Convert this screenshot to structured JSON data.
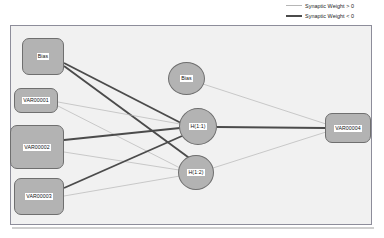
{
  "legend": {
    "items": [
      {
        "label": "Synaptic Weight > 0",
        "style": "thin-light",
        "color": "#b6b6b6"
      },
      {
        "label": "Synaptic Weight < 0",
        "style": "thick-dark",
        "color": "#4b4b4b"
      }
    ]
  },
  "diagram": {
    "panel_background": "#f1f1f1",
    "node_fill": "#b3b3b3",
    "node_stroke": "#6f6f6f",
    "layers": {
      "input": {
        "name": "Input Layer",
        "nodes": [
          {
            "id": "in-bias",
            "label": "Bias",
            "shape": "box",
            "x": 22,
            "y": 38,
            "w": 42,
            "h": 37
          },
          {
            "id": "in-var1",
            "label": "VAR00001",
            "shape": "box",
            "x": 14,
            "y": 88,
            "w": 44,
            "h": 25
          },
          {
            "id": "in-var2",
            "label": "VAR00002",
            "shape": "box",
            "x": 10,
            "y": 125,
            "w": 54,
            "h": 44
          },
          {
            "id": "in-var3",
            "label": "VAR00003",
            "shape": "box",
            "x": 14,
            "y": 178,
            "w": 50,
            "h": 37
          }
        ]
      },
      "hidden": {
        "name": "Hidden Layer",
        "nodes": [
          {
            "id": "h-bias",
            "label": "Bias",
            "shape": "ellipse",
            "x": 168,
            "y": 62,
            "w": 37,
            "h": 33
          },
          {
            "id": "h-1-1",
            "label": "H(1:1)",
            "shape": "ellipse",
            "x": 179,
            "y": 108,
            "w": 38,
            "h": 37
          },
          {
            "id": "h-1-2",
            "label": "H(1:2)",
            "shape": "ellipse",
            "x": 178,
            "y": 155,
            "w": 36,
            "h": 35
          }
        ]
      },
      "output": {
        "name": "Output Layer",
        "nodes": [
          {
            "id": "out-var4",
            "label": "VAR00004",
            "shape": "box",
            "x": 325,
            "y": 113,
            "w": 46,
            "h": 30
          }
        ]
      }
    },
    "edges": [
      {
        "from": "in-bias",
        "to": "h-1-1",
        "sign": "negative",
        "x1": 64,
        "y1": 63,
        "x2": 181,
        "y2": 123
      },
      {
        "from": "in-bias",
        "to": "h-1-2",
        "sign": "negative",
        "x1": 64,
        "y1": 66,
        "x2": 192,
        "y2": 160
      },
      {
        "from": "in-var1",
        "to": "h-1-1",
        "sign": "positive",
        "x1": 58,
        "y1": 102,
        "x2": 180,
        "y2": 124
      },
      {
        "from": "in-var1",
        "to": "h-1-2",
        "sign": "positive",
        "x1": 58,
        "y1": 106,
        "x2": 180,
        "y2": 168
      },
      {
        "from": "in-var2",
        "to": "h-1-1",
        "sign": "negative",
        "x1": 64,
        "y1": 140,
        "x2": 180,
        "y2": 128
      },
      {
        "from": "in-var2",
        "to": "h-1-2",
        "sign": "positive",
        "x1": 64,
        "y1": 152,
        "x2": 179,
        "y2": 170
      },
      {
        "from": "in-var3",
        "to": "h-1-1",
        "sign": "negative",
        "x1": 64,
        "y1": 188,
        "x2": 182,
        "y2": 136
      },
      {
        "from": "in-var3",
        "to": "h-1-2",
        "sign": "positive",
        "x1": 64,
        "y1": 196,
        "x2": 180,
        "y2": 176
      },
      {
        "from": "h-bias",
        "to": "out-var4",
        "sign": "positive",
        "x1": 203,
        "y1": 84,
        "x2": 326,
        "y2": 124
      },
      {
        "from": "h-1-1",
        "to": "out-var4",
        "sign": "negative",
        "x1": 217,
        "y1": 127,
        "x2": 325,
        "y2": 128
      },
      {
        "from": "h-1-2",
        "to": "out-var4",
        "sign": "positive",
        "x1": 213,
        "y1": 168,
        "x2": 326,
        "y2": 132
      }
    ]
  }
}
